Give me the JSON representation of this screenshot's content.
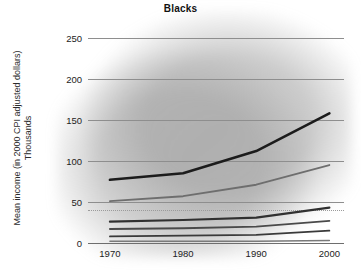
{
  "chart_data": {
    "type": "line",
    "title": "Blacks",
    "xlabel": "",
    "ylabel": "Mean income (in 2000 CPI adjusted dollars)",
    "ylabel_line2": "Thousands",
    "x": [
      1970,
      1980,
      1990,
      2000
    ],
    "xtick_labels": [
      "1970",
      "1980",
      "1990",
      "2000"
    ],
    "ytick_labels": [
      "0",
      "50",
      "100",
      "150",
      "200",
      "250"
    ],
    "yticks": [
      0,
      50,
      100,
      150,
      200,
      250
    ],
    "ylim": [
      0,
      262
    ],
    "xlim": [
      1967,
      2002
    ],
    "grid": "horizontal",
    "legend": "none",
    "background_note": "grey blurred scan smudge behind plot",
    "series": [
      {
        "name": "Top percentile",
        "color": "#1c1c1c",
        "width": 2.6,
        "values": [
          77,
          85,
          112,
          158
        ]
      },
      {
        "name": "Second percentile",
        "color": "#6e6e6e",
        "width": 1.8,
        "values": [
          51,
          57,
          71,
          95
        ]
      },
      {
        "name": "Third percentile",
        "color": "#303030",
        "width": 2.2,
        "values": [
          26,
          28,
          31,
          43
        ]
      },
      {
        "name": "Fourth percentile",
        "color": "#4a4a4a",
        "width": 1.9,
        "values": [
          17,
          18,
          20,
          27
        ]
      },
      {
        "name": "Fifth percentile",
        "color": "#3a3a3a",
        "width": 1.8,
        "values": [
          8,
          9,
          10,
          15
        ]
      },
      {
        "name": "Bottom percentile",
        "color": "#7a7a7a",
        "width": 1.5,
        "values": [
          2,
          2,
          2,
          3
        ]
      }
    ],
    "reference_lines": [
      {
        "name": "dotted-reference",
        "value": 40,
        "style": "dotted",
        "color": "#9b9b9b"
      }
    ]
  }
}
